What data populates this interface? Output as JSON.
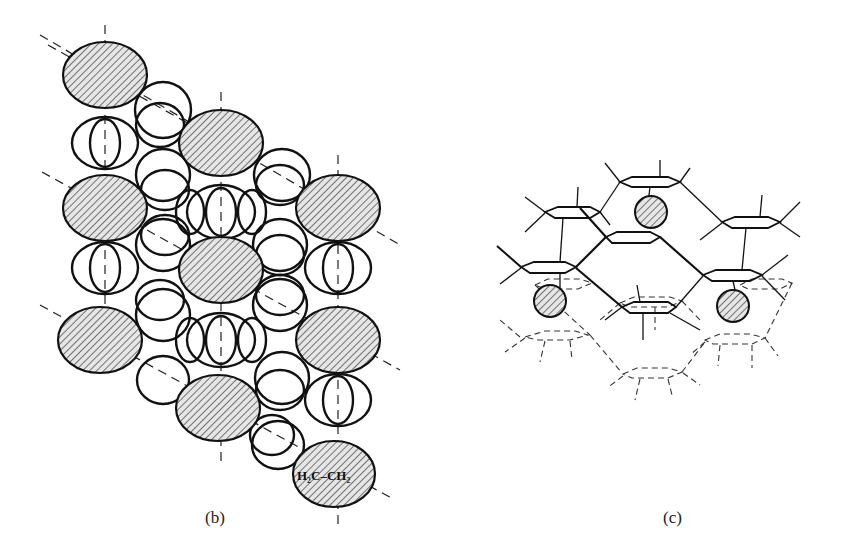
{
  "figure": {
    "panels": [
      {
        "id": "b",
        "caption": "(b)",
        "description": "Packing diagram of molecules (overlapping rings) with hatched ethylene guests along dashed lattice lines",
        "guest_label": "H₂C–CH₂",
        "elements": {
          "hatched_guest_ellipses": 11,
          "dashed_vertical_axes": 3,
          "dashed_diagonal_axes": 4
        }
      },
      {
        "id": "c",
        "caption": "(c)",
        "description": "Perspective view of stacked hexagonal layers (solid upper, dashed lower) with three hatched guest spheres",
        "elements": {
          "hatched_guest_spheres": 3,
          "solid_layer": "upper",
          "dashed_layer": "lower"
        }
      }
    ]
  }
}
